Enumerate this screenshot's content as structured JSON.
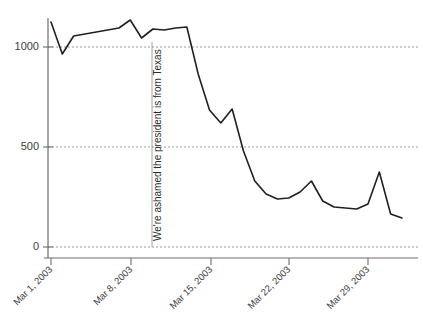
{
  "chart_data": {
    "type": "line",
    "title": "",
    "subtitle": "",
    "xlabel": "",
    "ylabel": "",
    "grid": true,
    "legend": "none",
    "xlim": [
      "Mar 1, 2003",
      "Apr 1, 2003"
    ],
    "ylim": [
      0,
      1200
    ],
    "yticks": [
      0,
      500,
      1000
    ],
    "ytick_labels": [
      "0",
      "500",
      "1000"
    ],
    "xtick_labels": [
      "Mar 1, 2003",
      "Mar 8, 2003",
      "Mar 15, 2003",
      "Mar 22, 2003",
      "Mar 29, 2003"
    ],
    "xtick_dates": [
      "2003-03-01",
      "2003-03-08",
      "2003-03-15",
      "2003-03-22",
      "2003-03-29"
    ],
    "series": [
      {
        "name": "Airplay spins",
        "color": "#231f20",
        "x": [
          "Mar 1, 2003",
          "Mar 2, 2003",
          "Mar 3, 2003",
          "Mar 4, 2003",
          "Mar 5, 2003",
          "Mar 6, 2003",
          "Mar 7, 2003",
          "Mar 8, 2003",
          "Mar 9, 2003",
          "Mar 10, 2003",
          "Mar 11, 2003",
          "Mar 12, 2003",
          "Mar 13, 2003",
          "Mar 14, 2003",
          "Mar 15, 2003",
          "Mar 16, 2003",
          "Mar 17, 2003",
          "Mar 18, 2003",
          "Mar 19, 2003",
          "Mar 20, 2003",
          "Mar 21, 2003",
          "Mar 22, 2003",
          "Mar 23, 2003",
          "Mar 24, 2003",
          "Mar 25, 2003",
          "Mar 26, 2003",
          "Mar 27, 2003",
          "Mar 28, 2003",
          "Mar 29, 2003",
          "Mar 30, 2003",
          "Mar 31, 2003",
          "Apr 1, 2003"
        ],
        "values": [
          1125,
          965,
          1055,
          1065,
          1075,
          1085,
          1095,
          1135,
          1045,
          1090,
          1085,
          1095,
          1100,
          865,
          685,
          620,
          690,
          480,
          330,
          265,
          240,
          245,
          275,
          330,
          230,
          200,
          195,
          190,
          215,
          375,
          165,
          145
        ]
      }
    ],
    "annotations": [
      {
        "text": "We're ashamed the president is from Texas",
        "x": "Mar 10, 2003",
        "orientation": "vertical",
        "rule": true
      }
    ]
  },
  "axes": {
    "y_axis_name": "y-axis",
    "x_axis_name": "x-axis"
  }
}
